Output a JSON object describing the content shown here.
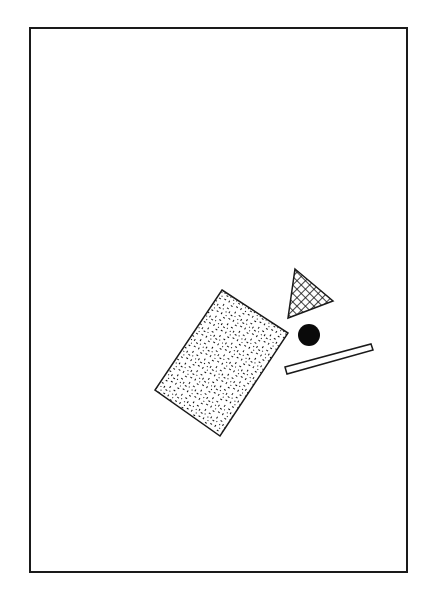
{
  "canvas": {
    "width": 426,
    "height": 596,
    "background": "#ffffff"
  },
  "frame": {
    "x": 30,
    "y": 28,
    "width": 377,
    "height": 544,
    "stroke": "#1a1a1a",
    "stroke_width": 2
  },
  "shapes": [
    {
      "id": "speckled-rectangle",
      "type": "polygon",
      "fill_pattern": "speckle",
      "points": "222,290 288,333 220,436 155,390",
      "stroke": "#1a1a1a"
    },
    {
      "id": "crosshatched-triangle",
      "type": "polygon",
      "fill_pattern": "crosshatch",
      "points": "295,269 333,301 288,318",
      "stroke": "#1a1a1a"
    },
    {
      "id": "black-circle",
      "type": "circle",
      "cx": 309,
      "cy": 335,
      "r": 11,
      "fill": "#0a0a0a"
    },
    {
      "id": "thin-bar",
      "type": "polygon",
      "fill": "#ffffff",
      "points": "285,367 371,344 373,350 287,374",
      "stroke": "#1a1a1a"
    }
  ]
}
